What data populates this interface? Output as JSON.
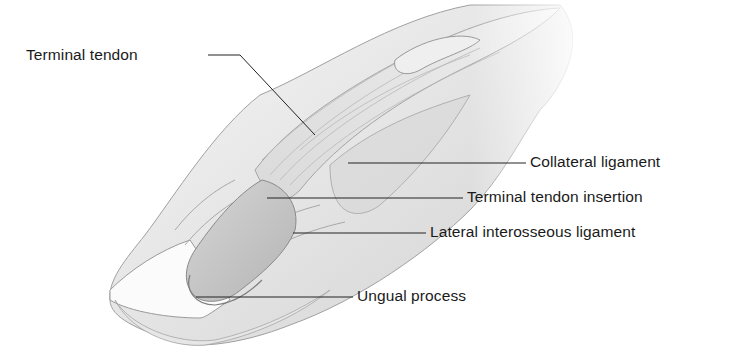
{
  "figure": {
    "labels": [
      {
        "id": "terminal-tendon",
        "text": "Terminal tendon",
        "x": 26,
        "y": 46
      },
      {
        "id": "collateral-ligament",
        "text": "Collateral ligament",
        "x": 530,
        "y": 153
      },
      {
        "id": "terminal-tendon-insertion",
        "text": "Terminal tendon insertion",
        "x": 467,
        "y": 188
      },
      {
        "id": "lateral-interosseous-ligament",
        "text": "Lateral interosseous ligament",
        "x": 430,
        "y": 223
      },
      {
        "id": "ungual-process",
        "text": "Ungual process",
        "x": 357,
        "y": 287
      }
    ],
    "colors": {
      "background": "#ffffff",
      "text": "#1a1a1a",
      "leader_line": "#222222",
      "skin_light": "#f2f2f2",
      "skin_mid": "#dcdcdc",
      "skin_dark": "#a8a8a8",
      "bone": "#c4c4c4",
      "outline": "#9a9a9a"
    }
  }
}
